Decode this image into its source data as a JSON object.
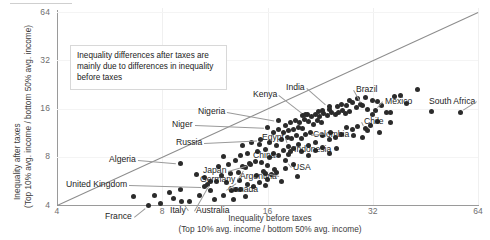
{
  "chart_data": {
    "type": "scatter",
    "title": "",
    "xlabel": "Inequality before taxes",
    "xlabel_sub": "(Top 10% avg. income / bottom 50% avg. income)",
    "ylabel": "Inequality after taxes",
    "ylabel_sub": "(Top 10% avg. income / bottom 50% avg. income)",
    "xscale": "log2",
    "yscale": "log2",
    "xlim": [
      4,
      64
    ],
    "ylim": [
      4,
      64
    ],
    "xticks": [
      4,
      8,
      16,
      32,
      64
    ],
    "yticks": [
      4,
      8,
      16,
      32,
      64
    ],
    "grid": "light",
    "legend": "none",
    "reference_line": {
      "type": "identity",
      "label": "y = x"
    },
    "annotation": "Inequality differences after taxes are mainly due to differences in inequality before taxes",
    "point_color": "#2b2b2b",
    "points": [
      {
        "label": "France",
        "x": 7.3,
        "y": 4.0
      },
      {
        "label": "Italy",
        "x": 9.1,
        "y": 4.2
      },
      {
        "label": "Australia",
        "x": 11.0,
        "y": 5.6
      },
      {
        "label": "United Kingdom",
        "x": 10.6,
        "y": 5.2
      },
      {
        "label": "Canada",
        "x": 13.3,
        "y": 5.7
      },
      {
        "label": "Germany",
        "x": 13.8,
        "y": 6.9
      },
      {
        "label": "Japan",
        "x": 14.3,
        "y": 7.2
      },
      {
        "label": "Algeria",
        "x": 9.0,
        "y": 7.3
      },
      {
        "label": "Russia",
        "x": 15.3,
        "y": 10.2
      },
      {
        "label": "Niger",
        "x": 16.0,
        "y": 12.2
      },
      {
        "label": "Nigeria",
        "x": 17.2,
        "y": 13.4
      },
      {
        "label": "Argentina",
        "x": 15.8,
        "y": 6.3
      },
      {
        "label": "China",
        "x": 16.2,
        "y": 7.9
      },
      {
        "label": "USA",
        "x": 18.0,
        "y": 7.6
      },
      {
        "label": "Indonesia",
        "x": 18.6,
        "y": 8.6
      },
      {
        "label": "Egypt",
        "x": 18.4,
        "y": 9.3
      },
      {
        "label": "Kenya",
        "x": 20.5,
        "y": 14.6
      },
      {
        "label": "India",
        "x": 24.0,
        "y": 16.4
      },
      {
        "label": "Colombia",
        "x": 24.2,
        "y": 11.4
      },
      {
        "label": "Brazil",
        "x": 30.0,
        "y": 16.8
      },
      {
        "label": "Chile",
        "x": 30.5,
        "y": 12.0
      },
      {
        "label": "Mexico",
        "x": 32.5,
        "y": 15.5
      },
      {
        "label": "South Africa",
        "x": 57.0,
        "y": 15.2
      }
    ],
    "unlabeled_points": [
      [
        6.6,
        4.5
      ],
      [
        7.9,
        4.1
      ],
      [
        8.6,
        4.4
      ],
      [
        9.6,
        4.2
      ],
      [
        10.2,
        4.6
      ],
      [
        11.3,
        4.3
      ],
      [
        11.0,
        4.9
      ],
      [
        12.0,
        4.6
      ],
      [
        12.6,
        4.9
      ],
      [
        13.0,
        5.0
      ],
      [
        13.4,
        5.0
      ],
      [
        12.2,
        5.5
      ],
      [
        11.4,
        5.6
      ],
      [
        10.6,
        5.9
      ],
      [
        10.0,
        6.2
      ],
      [
        11.8,
        6.1
      ],
      [
        12.5,
        6.3
      ],
      [
        13.2,
        6.4
      ],
      [
        14.0,
        5.4
      ],
      [
        14.6,
        5.2
      ],
      [
        15.2,
        5.5
      ],
      [
        15.8,
        5.3
      ],
      [
        14.9,
        6.1
      ],
      [
        15.6,
        6.5
      ],
      [
        16.4,
        6.2
      ],
      [
        16.8,
        6.7
      ],
      [
        13.6,
        7.0
      ],
      [
        14.2,
        7.3
      ],
      [
        14.8,
        7.5
      ],
      [
        15.4,
        7.4
      ],
      [
        16.0,
        7.1
      ],
      [
        13.0,
        7.6
      ],
      [
        12.4,
        7.2
      ],
      [
        11.6,
        7.0
      ],
      [
        12.0,
        8.0
      ],
      [
        13.4,
        8.2
      ],
      [
        14.0,
        8.4
      ],
      [
        15.0,
        8.6
      ],
      [
        15.8,
        8.9
      ],
      [
        16.6,
        8.4
      ],
      [
        17.2,
        8.1
      ],
      [
        17.8,
        8.8
      ],
      [
        18.4,
        8.3
      ],
      [
        19.0,
        9.0
      ],
      [
        19.6,
        9.6
      ],
      [
        17.0,
        9.4
      ],
      [
        16.2,
        9.8
      ],
      [
        15.2,
        9.6
      ],
      [
        14.4,
        9.8
      ],
      [
        13.6,
        9.4
      ],
      [
        17.6,
        10.2
      ],
      [
        18.2,
        10.6
      ],
      [
        18.8,
        10.4
      ],
      [
        19.4,
        10.8
      ],
      [
        20.0,
        10.4
      ],
      [
        20.6,
        11.0
      ],
      [
        21.2,
        11.4
      ],
      [
        20.2,
        12.0
      ],
      [
        19.6,
        12.2
      ],
      [
        19.0,
        11.8
      ],
      [
        18.4,
        11.6
      ],
      [
        17.8,
        11.4
      ],
      [
        17.2,
        11.8
      ],
      [
        16.6,
        11.4
      ],
      [
        18.0,
        12.6
      ],
      [
        18.6,
        13.0
      ],
      [
        19.2,
        13.4
      ],
      [
        19.8,
        13.0
      ],
      [
        20.4,
        13.6
      ],
      [
        21.0,
        13.2
      ],
      [
        21.6,
        12.8
      ],
      [
        22.2,
        13.4
      ],
      [
        22.8,
        13.0
      ],
      [
        21.4,
        14.2
      ],
      [
        20.8,
        14.6
      ],
      [
        20.2,
        14.4
      ],
      [
        22.0,
        14.6
      ],
      [
        22.6,
        14.2
      ],
      [
        23.2,
        14.8
      ],
      [
        23.8,
        14.4
      ],
      [
        24.4,
        15.0
      ],
      [
        25.0,
        14.6
      ],
      [
        23.0,
        15.6
      ],
      [
        22.4,
        15.4
      ],
      [
        24.0,
        15.8
      ],
      [
        25.6,
        15.2
      ],
      [
        26.2,
        15.6
      ],
      [
        26.8,
        14.8
      ],
      [
        27.4,
        15.4
      ],
      [
        25.4,
        16.4
      ],
      [
        26.0,
        17.0
      ],
      [
        27.0,
        16.6
      ],
      [
        28.0,
        17.4
      ],
      [
        28.8,
        16.2
      ],
      [
        29.6,
        17.0
      ],
      [
        31.0,
        15.8
      ],
      [
        32.0,
        14.6
      ],
      [
        33.0,
        13.2
      ],
      [
        31.6,
        12.6
      ],
      [
        29.0,
        12.4
      ],
      [
        28.0,
        11.8
      ],
      [
        27.0,
        12.2
      ],
      [
        26.0,
        11.0
      ],
      [
        25.0,
        10.6
      ],
      [
        24.0,
        10.2
      ],
      [
        23.0,
        10.8
      ],
      [
        22.0,
        9.8
      ],
      [
        21.0,
        9.4
      ],
      [
        20.0,
        8.6
      ],
      [
        21.0,
        8.2
      ],
      [
        22.0,
        8.8
      ],
      [
        23.0,
        9.2
      ],
      [
        24.0,
        8.4
      ],
      [
        25.2,
        9.0
      ],
      [
        28.2,
        10.8
      ],
      [
        30.0,
        10.6
      ],
      [
        31.0,
        11.6
      ],
      [
        33.5,
        11.4
      ],
      [
        35.0,
        15.0
      ],
      [
        36.0,
        15.2
      ],
      [
        37.0,
        19.0
      ],
      [
        38.5,
        19.4
      ],
      [
        40.0,
        17.2
      ],
      [
        43.0,
        21.0
      ],
      [
        47.0,
        15.3
      ],
      [
        36.0,
        13.0
      ],
      [
        34.0,
        16.8
      ],
      [
        33.0,
        17.6
      ],
      [
        32.0,
        18.0
      ],
      [
        30.5,
        18.8
      ],
      [
        29.0,
        18.4
      ],
      [
        27.5,
        18.0
      ],
      [
        17.0,
        6.4
      ],
      [
        18.0,
        6.8
      ],
      [
        19.0,
        7.2
      ],
      [
        16.0,
        5.8
      ],
      [
        17.5,
        5.6
      ],
      [
        19.5,
        6.0
      ],
      [
        9.0,
        5.0
      ],
      [
        8.4,
        4.8
      ],
      [
        7.6,
        4.6
      ],
      [
        12.8,
        4.3
      ],
      [
        13.8,
        4.5
      ],
      [
        10.8,
        5.4
      ]
    ]
  },
  "labels": {
    "tick_4": "4",
    "tick_8": "8",
    "tick_16": "16",
    "tick_32": "32",
    "tick_64": "64"
  }
}
